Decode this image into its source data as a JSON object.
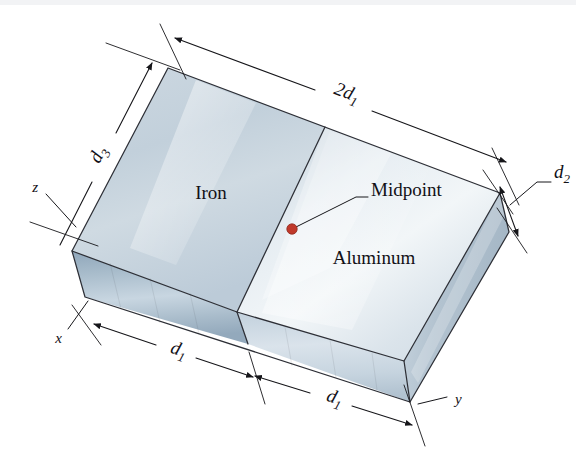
{
  "figure": {
    "kind": "3d-block-diagram"
  },
  "materials": [
    {
      "id": "iron",
      "label": "Iron"
    },
    {
      "id": "aluminum",
      "label": "Aluminum"
    }
  ],
  "callouts": [
    {
      "id": "midpoint",
      "label": "Midpoint",
      "marker_color": "#c0392b"
    }
  ],
  "dimensions": [
    {
      "id": "total-length",
      "base": "2d",
      "sub": "1",
      "label": "2d1"
    },
    {
      "id": "depth",
      "base": "d",
      "sub": "3",
      "label": "d3"
    },
    {
      "id": "height",
      "base": "d",
      "sub": "2",
      "label": "d2"
    },
    {
      "id": "half-length-left",
      "base": "d",
      "sub": "1",
      "label": "d1"
    },
    {
      "id": "half-length-right",
      "base": "d",
      "sub": "1",
      "label": "d1"
    }
  ],
  "axes": [
    {
      "id": "z",
      "label": "z"
    },
    {
      "id": "x",
      "label": "x"
    },
    {
      "id": "y",
      "label": "y"
    }
  ],
  "colors": {
    "top_face_iron": "#c6d2dc",
    "top_face_aluminum": "#dfe7ee",
    "front_face": "#9fb3c4",
    "front_face_light": "#c3d2de",
    "right_face": "#b9c8d4",
    "outline": "#2d2f36",
    "midpoint_dot": "#c0392b",
    "background": "#ffffff"
  }
}
